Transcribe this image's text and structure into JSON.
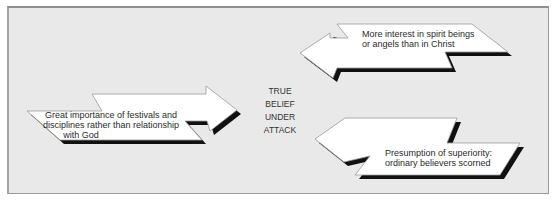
{
  "diagram": {
    "center_label": [
      "TRUE",
      "BELIEF",
      "UNDER",
      "ATTACK"
    ],
    "arrows": [
      {
        "id": "left",
        "direction": "right",
        "lines": [
          "Great importance of festivals and",
          "disciplines rather than relationship",
          "with God"
        ]
      },
      {
        "id": "top-right",
        "direction": "left",
        "lines": [
          "More interest in spirit beings",
          "or angels than in Christ"
        ]
      },
      {
        "id": "bottom-right",
        "direction": "left",
        "lines": [
          "Presumption of superiority:",
          "ordinary believers scorned"
        ]
      }
    ],
    "colors": {
      "background": "#e9e9e9",
      "border": "#9a9a9a",
      "arrow_fill": "#ffffff",
      "arrow_outline": "#9a9a9a",
      "shadow": "#111111",
      "text": "#2a2a2a"
    }
  }
}
